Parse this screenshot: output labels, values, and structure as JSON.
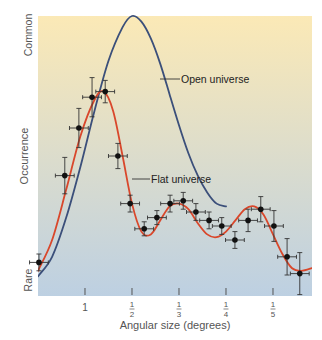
{
  "chart_data": {
    "type": "line",
    "title": "",
    "xlabel": "Angular size (degrees)",
    "ylabel": "Occurrence",
    "y_ticks": [
      {
        "label": "Rare",
        "value": 0
      },
      {
        "label": "Common",
        "value": 1
      }
    ],
    "x_ticks": [
      {
        "label": "1",
        "num": "1",
        "den": "",
        "value": 1
      },
      {
        "label": "1/2",
        "num": "1",
        "den": "2",
        "value": 2
      },
      {
        "label": "1/3",
        "num": "1",
        "den": "3",
        "value": 3
      },
      {
        "label": "1/4",
        "num": "1",
        "den": "4",
        "value": 4
      },
      {
        "label": "1/5",
        "num": "1",
        "den": "5",
        "value": 5
      }
    ],
    "xlim": [
      0,
      5.83
    ],
    "ylim": [
      0,
      1
    ],
    "grid": false,
    "background_gradient": [
      "#fbe9b6",
      "#bdd0e2"
    ],
    "series": [
      {
        "name": "Open universe",
        "color": "#3b4f7a",
        "x": [
          0.0,
          0.3,
          0.6,
          0.9,
          1.2,
          1.5,
          1.8,
          2.0,
          2.2,
          2.4,
          2.6,
          2.8,
          3.0,
          3.2,
          3.4,
          3.6,
          3.8,
          4.0
        ],
        "y": [
          0.07,
          0.14,
          0.28,
          0.46,
          0.66,
          0.84,
          0.96,
          1.0,
          0.98,
          0.92,
          0.83,
          0.72,
          0.61,
          0.51,
          0.43,
          0.37,
          0.33,
          0.32
        ]
      },
      {
        "name": "Flat universe",
        "color": "#d9472b",
        "x": [
          0.0,
          0.3,
          0.6,
          0.9,
          1.2,
          1.4,
          1.6,
          1.8,
          2.0,
          2.2,
          2.4,
          2.6,
          2.8,
          3.0,
          3.2,
          3.4,
          3.6,
          3.8,
          4.0,
          4.2,
          4.4,
          4.6,
          4.8,
          5.0,
          5.2,
          5.4,
          5.6,
          5.83
        ],
        "y": [
          0.09,
          0.2,
          0.38,
          0.57,
          0.7,
          0.73,
          0.66,
          0.5,
          0.33,
          0.23,
          0.22,
          0.27,
          0.32,
          0.33,
          0.31,
          0.26,
          0.22,
          0.21,
          0.23,
          0.27,
          0.31,
          0.32,
          0.29,
          0.22,
          0.15,
          0.1,
          0.09,
          0.1
        ]
      }
    ],
    "annotations": [
      {
        "text": "Open universe",
        "series": "Open universe"
      },
      {
        "text": "Flat universe",
        "series": "Flat universe"
      }
    ],
    "measurements": {
      "name": "Observed data",
      "color": "#111111",
      "x": [
        0.02,
        0.57,
        0.87,
        1.15,
        1.43,
        1.7,
        1.96,
        2.26,
        2.53,
        2.81,
        3.09,
        3.36,
        3.64,
        3.91,
        4.19,
        4.47,
        4.74,
        5.02,
        5.3,
        5.57
      ],
      "y": [
        0.12,
        0.43,
        0.6,
        0.71,
        0.73,
        0.5,
        0.33,
        0.24,
        0.28,
        0.33,
        0.34,
        0.3,
        0.27,
        0.25,
        0.2,
        0.27,
        0.31,
        0.25,
        0.14,
        0.08
      ],
      "y_err": [
        0.03,
        0.065,
        0.07,
        0.07,
        0.04,
        0.045,
        0.03,
        0.025,
        0.025,
        0.03,
        0.03,
        0.03,
        0.03,
        0.03,
        0.03,
        0.04,
        0.045,
        0.055,
        0.065,
        0.075
      ],
      "x_err": 0.2
    }
  }
}
